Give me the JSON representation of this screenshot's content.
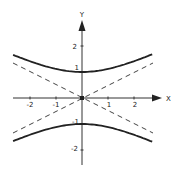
{
  "diagram": {
    "title": "",
    "axes": {
      "x_label": "X",
      "y_label": "Y",
      "x_ticks": [
        {
          "value": -2,
          "label": "-2"
        },
        {
          "value": -1,
          "label": "-1"
        },
        {
          "value": 1,
          "label": "1"
        },
        {
          "value": 2,
          "label": "2"
        }
      ],
      "y_ticks": [
        {
          "value": 2,
          "label": "2"
        },
        {
          "value": 1,
          "label": "1"
        },
        {
          "value": -1,
          "label": "-1"
        },
        {
          "value": -2,
          "label": "-2"
        }
      ]
    },
    "curves": [
      {
        "name": "hyperbola-upper-branch",
        "equation": "y^2 - x^2/4 = 1, y>0",
        "style": "solid"
      },
      {
        "name": "hyperbola-lower-branch",
        "equation": "y^2 - x^2/4 = 1, y<0",
        "style": "solid"
      },
      {
        "name": "asymptote-positive",
        "equation": "y = x/2",
        "style": "dashed"
      },
      {
        "name": "asymptote-negative",
        "equation": "y = -x/2",
        "style": "dashed"
      }
    ],
    "colors": {
      "curve": "#222222",
      "axis": "#333333",
      "asymptote": "#444444",
      "background": "#ffffff"
    }
  }
}
